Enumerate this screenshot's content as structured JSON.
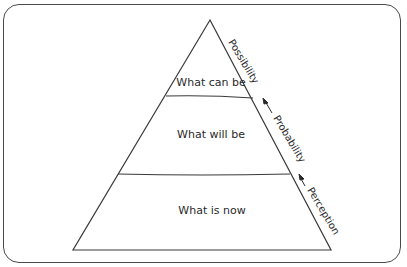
{
  "diagram": {
    "type": "pyramid",
    "tiers": [
      {
        "label": "What can be"
      },
      {
        "label": "What will be"
      },
      {
        "label": "What is now"
      }
    ],
    "side_labels": [
      {
        "label": "Possibility",
        "arrow": false
      },
      {
        "label": "Probability",
        "arrow": true
      },
      {
        "label": "Perception",
        "arrow": true
      }
    ],
    "colors": {
      "stroke": "#3a3a3a",
      "background": "#ffffff",
      "frame": "#4a4a4a"
    }
  }
}
